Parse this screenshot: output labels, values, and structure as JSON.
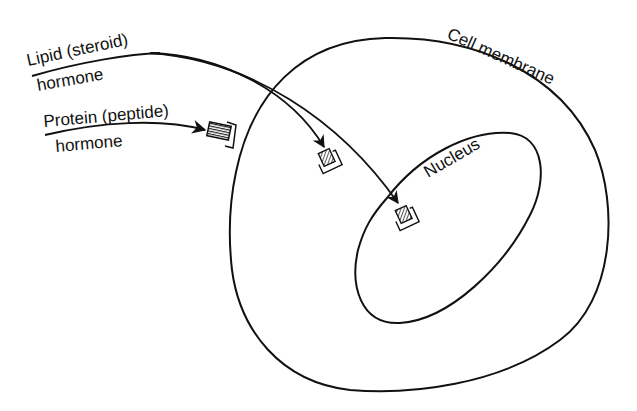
{
  "diagram": {
    "type": "cell hormone signaling schematic",
    "labels": {
      "lipid_line1": "Lipid (steroid)",
      "lipid_line2": "hormone",
      "protein_line1": "Protein (peptide)",
      "protein_line2": "hormone",
      "cell_membrane": "Cell membrane",
      "nucleus": "Nucleus"
    },
    "elements": [
      {
        "name": "cell-membrane",
        "shape": "rounded closed curve"
      },
      {
        "name": "nucleus",
        "shape": "oval inside cell"
      },
      {
        "name": "lipid-hormone-arrow-cytoplasm",
        "target": "cytoplasmic receptor"
      },
      {
        "name": "lipid-hormone-arrow-nucleus",
        "target": "nuclear receptor"
      },
      {
        "name": "protein-hormone-arrow",
        "target": "membrane receptor"
      }
    ],
    "colors": {
      "stroke": "#111111",
      "background": "#ffffff"
    }
  }
}
